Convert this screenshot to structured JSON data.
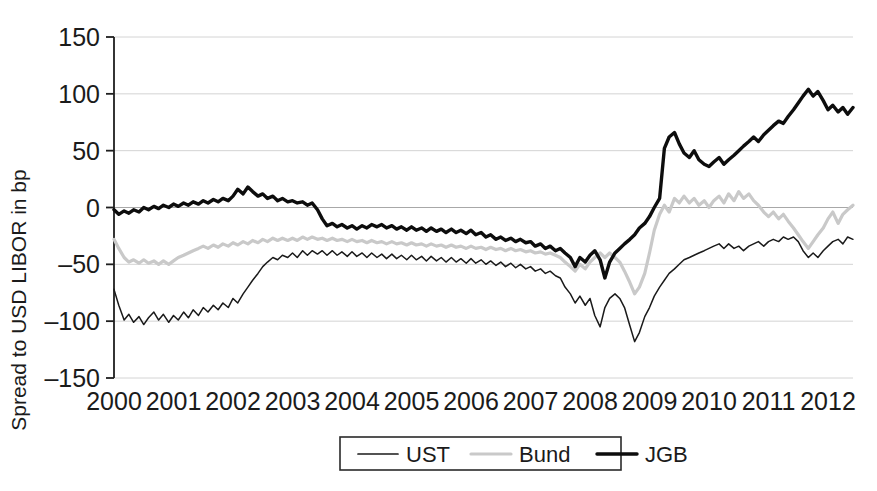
{
  "chart_data": {
    "type": "line",
    "title": "",
    "xlabel": "",
    "ylabel": "Spread to USD LIBOR in bp",
    "xlim": [
      2000.0,
      2012.42
    ],
    "ylim": [
      -150,
      150
    ],
    "ytick_labels": [
      "150",
      "100",
      "50",
      "0",
      "-50",
      "-100",
      "-150"
    ],
    "ytick_values": [
      150,
      100,
      50,
      0,
      -50,
      -100,
      -150
    ],
    "xtick_labels": [
      "2000",
      "2001",
      "2002",
      "2003",
      "2004",
      "2005",
      "2006",
      "2007",
      "2008",
      "2009",
      "2010",
      "2011",
      "2012"
    ],
    "xtick_values": [
      2000,
      2001,
      2002,
      2003,
      2004,
      2005,
      2006,
      2007,
      2008,
      2009,
      2010,
      2011,
      2012
    ],
    "grid": true,
    "legend_position": "bottom-center",
    "series": [
      {
        "name": "UST",
        "color": "#1a1a1a",
        "width": 1.5,
        "x": [
          2000.0,
          2000.08,
          2000.17,
          2000.25,
          2000.33,
          2000.42,
          2000.5,
          2000.58,
          2000.67,
          2000.75,
          2000.83,
          2000.92,
          2001.0,
          2001.08,
          2001.17,
          2001.25,
          2001.33,
          2001.42,
          2001.5,
          2001.58,
          2001.67,
          2001.75,
          2001.83,
          2001.92,
          2002.0,
          2002.08,
          2002.17,
          2002.25,
          2002.33,
          2002.42,
          2002.5,
          2002.58,
          2002.67,
          2002.75,
          2002.83,
          2002.92,
          2003.0,
          2003.08,
          2003.17,
          2003.25,
          2003.33,
          2003.42,
          2003.5,
          2003.58,
          2003.67,
          2003.75,
          2003.83,
          2003.92,
          2004.0,
          2004.08,
          2004.17,
          2004.25,
          2004.33,
          2004.42,
          2004.5,
          2004.58,
          2004.67,
          2004.75,
          2004.83,
          2004.92,
          2005.0,
          2005.08,
          2005.17,
          2005.25,
          2005.33,
          2005.42,
          2005.5,
          2005.58,
          2005.67,
          2005.75,
          2005.83,
          2005.92,
          2006.0,
          2006.08,
          2006.17,
          2006.25,
          2006.33,
          2006.42,
          2006.5,
          2006.58,
          2006.67,
          2006.75,
          2006.83,
          2006.92,
          2007.0,
          2007.08,
          2007.17,
          2007.25,
          2007.33,
          2007.42,
          2007.5,
          2007.58,
          2007.67,
          2007.75,
          2007.83,
          2007.92,
          2008.0,
          2008.08,
          2008.17,
          2008.25,
          2008.33,
          2008.42,
          2008.5,
          2008.58,
          2008.67,
          2008.75,
          2008.83,
          2008.92,
          2009.0,
          2009.08,
          2009.17,
          2009.25,
          2009.33,
          2009.42,
          2009.5,
          2009.58,
          2009.67,
          2009.75,
          2009.83,
          2009.92,
          2010.0,
          2010.08,
          2010.17,
          2010.25,
          2010.33,
          2010.42,
          2010.5,
          2010.58,
          2010.67,
          2010.75,
          2010.83,
          2010.92,
          2011.0,
          2011.08,
          2011.17,
          2011.25,
          2011.33,
          2011.42,
          2011.5,
          2011.58,
          2011.67,
          2011.75,
          2011.83,
          2011.92,
          2012.0,
          2012.08,
          2012.17,
          2012.25,
          2012.33,
          2012.42
        ],
        "y": [
          -72,
          -86,
          -99,
          -94,
          -101,
          -96,
          -103,
          -97,
          -92,
          -99,
          -94,
          -101,
          -95,
          -99,
          -92,
          -97,
          -90,
          -95,
          -88,
          -92,
          -86,
          -90,
          -84,
          -88,
          -80,
          -84,
          -76,
          -70,
          -64,
          -58,
          -52,
          -48,
          -44,
          -46,
          -42,
          -44,
          -40,
          -44,
          -38,
          -42,
          -38,
          -41,
          -38,
          -42,
          -38,
          -42,
          -39,
          -43,
          -39,
          -43,
          -40,
          -44,
          -40,
          -44,
          -41,
          -45,
          -41,
          -45,
          -42,
          -46,
          -42,
          -46,
          -43,
          -47,
          -43,
          -47,
          -44,
          -48,
          -44,
          -48,
          -45,
          -49,
          -45,
          -49,
          -46,
          -50,
          -47,
          -51,
          -48,
          -52,
          -49,
          -53,
          -50,
          -54,
          -52,
          -56,
          -54,
          -58,
          -56,
          -60,
          -62,
          -70,
          -76,
          -84,
          -78,
          -86,
          -80,
          -95,
          -105,
          -88,
          -80,
          -76,
          -80,
          -88,
          -104,
          -118,
          -110,
          -96,
          -88,
          -78,
          -70,
          -64,
          -58,
          -54,
          -50,
          -46,
          -44,
          -42,
          -40,
          -38,
          -36,
          -34,
          -32,
          -36,
          -32,
          -36,
          -34,
          -38,
          -34,
          -32,
          -30,
          -34,
          -30,
          -28,
          -30,
          -26,
          -28,
          -26,
          -30,
          -38,
          -44,
          -40,
          -44,
          -38,
          -34,
          -30,
          -28,
          -32,
          -26,
          -28
        ]
      },
      {
        "name": "Bund",
        "color": "#c9c9c9",
        "width": 3.2,
        "x": [
          2000.0,
          2000.08,
          2000.17,
          2000.25,
          2000.33,
          2000.42,
          2000.5,
          2000.58,
          2000.67,
          2000.75,
          2000.83,
          2000.92,
          2001.0,
          2001.08,
          2001.17,
          2001.25,
          2001.33,
          2001.42,
          2001.5,
          2001.58,
          2001.67,
          2001.75,
          2001.83,
          2001.92,
          2002.0,
          2002.08,
          2002.17,
          2002.25,
          2002.33,
          2002.42,
          2002.5,
          2002.58,
          2002.67,
          2002.75,
          2002.83,
          2002.92,
          2003.0,
          2003.08,
          2003.17,
          2003.25,
          2003.33,
          2003.42,
          2003.5,
          2003.58,
          2003.67,
          2003.75,
          2003.83,
          2003.92,
          2004.0,
          2004.08,
          2004.17,
          2004.25,
          2004.33,
          2004.42,
          2004.5,
          2004.58,
          2004.67,
          2004.75,
          2004.83,
          2004.92,
          2005.0,
          2005.08,
          2005.17,
          2005.25,
          2005.33,
          2005.42,
          2005.5,
          2005.58,
          2005.67,
          2005.75,
          2005.83,
          2005.92,
          2006.0,
          2006.08,
          2006.17,
          2006.25,
          2006.33,
          2006.42,
          2006.5,
          2006.58,
          2006.67,
          2006.75,
          2006.83,
          2006.92,
          2007.0,
          2007.08,
          2007.17,
          2007.25,
          2007.33,
          2007.42,
          2007.5,
          2007.58,
          2007.67,
          2007.75,
          2007.83,
          2007.92,
          2008.0,
          2008.08,
          2008.17,
          2008.25,
          2008.33,
          2008.42,
          2008.5,
          2008.58,
          2008.67,
          2008.75,
          2008.83,
          2008.92,
          2009.0,
          2009.08,
          2009.17,
          2009.25,
          2009.33,
          2009.42,
          2009.5,
          2009.58,
          2009.67,
          2009.75,
          2009.83,
          2009.92,
          2010.0,
          2010.08,
          2010.17,
          2010.25,
          2010.33,
          2010.42,
          2010.5,
          2010.58,
          2010.67,
          2010.75,
          2010.83,
          2010.92,
          2011.0,
          2011.08,
          2011.17,
          2011.25,
          2011.33,
          2011.42,
          2011.5,
          2011.58,
          2011.67,
          2011.75,
          2011.83,
          2011.92,
          2012.0,
          2012.08,
          2012.17,
          2012.25,
          2012.33,
          2012.42
        ],
        "y": [
          -28,
          -36,
          -44,
          -48,
          -46,
          -49,
          -46,
          -49,
          -47,
          -50,
          -47,
          -50,
          -47,
          -44,
          -42,
          -40,
          -38,
          -36,
          -34,
          -36,
          -33,
          -35,
          -32,
          -34,
          -31,
          -33,
          -30,
          -32,
          -29,
          -31,
          -28,
          -30,
          -27,
          -29,
          -27,
          -29,
          -27,
          -29,
          -26,
          -28,
          -26,
          -28,
          -27,
          -29,
          -27,
          -29,
          -28,
          -30,
          -28,
          -30,
          -29,
          -31,
          -29,
          -31,
          -30,
          -32,
          -30,
          -32,
          -31,
          -33,
          -31,
          -33,
          -32,
          -34,
          -32,
          -34,
          -33,
          -35,
          -33,
          -35,
          -34,
          -36,
          -34,
          -36,
          -35,
          -37,
          -35,
          -37,
          -36,
          -38,
          -36,
          -38,
          -37,
          -39,
          -38,
          -40,
          -39,
          -41,
          -40,
          -42,
          -44,
          -48,
          -52,
          -56,
          -50,
          -54,
          -48,
          -44,
          -40,
          -44,
          -40,
          -44,
          -48,
          -56,
          -66,
          -76,
          -70,
          -58,
          -40,
          -20,
          -6,
          2,
          -4,
          8,
          4,
          10,
          4,
          8,
          2,
          6,
          0,
          6,
          10,
          4,
          12,
          6,
          14,
          8,
          12,
          6,
          2,
          -4,
          -8,
          -4,
          -10,
          -6,
          -12,
          -18,
          -24,
          -30,
          -36,
          -30,
          -24,
          -18,
          -10,
          -4,
          -14,
          -6,
          -2,
          2
        ]
      },
      {
        "name": "JGB",
        "color": "#0d0d0d",
        "width": 3.4,
        "x": [
          2000.0,
          2000.08,
          2000.17,
          2000.25,
          2000.33,
          2000.42,
          2000.5,
          2000.58,
          2000.67,
          2000.75,
          2000.83,
          2000.92,
          2001.0,
          2001.08,
          2001.17,
          2001.25,
          2001.33,
          2001.42,
          2001.5,
          2001.58,
          2001.67,
          2001.75,
          2001.83,
          2001.92,
          2002.0,
          2002.08,
          2002.17,
          2002.25,
          2002.33,
          2002.42,
          2002.5,
          2002.58,
          2002.67,
          2002.75,
          2002.83,
          2002.92,
          2003.0,
          2003.08,
          2003.17,
          2003.25,
          2003.33,
          2003.42,
          2003.5,
          2003.58,
          2003.67,
          2003.75,
          2003.83,
          2003.92,
          2004.0,
          2004.08,
          2004.17,
          2004.25,
          2004.33,
          2004.42,
          2004.5,
          2004.58,
          2004.67,
          2004.75,
          2004.83,
          2004.92,
          2005.0,
          2005.08,
          2005.17,
          2005.25,
          2005.33,
          2005.42,
          2005.5,
          2005.58,
          2005.67,
          2005.75,
          2005.83,
          2005.92,
          2006.0,
          2006.08,
          2006.17,
          2006.25,
          2006.33,
          2006.42,
          2006.5,
          2006.58,
          2006.67,
          2006.75,
          2006.83,
          2006.92,
          2007.0,
          2007.08,
          2007.17,
          2007.25,
          2007.33,
          2007.42,
          2007.5,
          2007.58,
          2007.67,
          2007.75,
          2007.83,
          2007.92,
          2008.0,
          2008.08,
          2008.17,
          2008.25,
          2008.33,
          2008.42,
          2008.5,
          2008.58,
          2008.67,
          2008.75,
          2008.83,
          2008.92,
          2009.0,
          2009.08,
          2009.17,
          2009.25,
          2009.33,
          2009.42,
          2009.5,
          2009.58,
          2009.67,
          2009.75,
          2009.83,
          2009.92,
          2010.0,
          2010.08,
          2010.17,
          2010.25,
          2010.33,
          2010.42,
          2010.5,
          2010.58,
          2010.67,
          2010.75,
          2010.83,
          2010.92,
          2011.0,
          2011.08,
          2011.17,
          2011.25,
          2011.33,
          2011.42,
          2011.5,
          2011.58,
          2011.67,
          2011.75,
          2011.83,
          2011.92,
          2012.0,
          2012.08,
          2012.17,
          2012.25,
          2012.33,
          2012.42
        ],
        "y": [
          -2,
          -6,
          -3,
          -5,
          -2,
          -4,
          0,
          -2,
          1,
          -1,
          2,
          0,
          3,
          1,
          4,
          2,
          5,
          3,
          6,
          4,
          7,
          5,
          8,
          6,
          10,
          16,
          12,
          18,
          14,
          10,
          12,
          8,
          10,
          6,
          8,
          5,
          6,
          4,
          5,
          2,
          4,
          -2,
          -10,
          -16,
          -14,
          -17,
          -15,
          -18,
          -16,
          -19,
          -16,
          -18,
          -15,
          -17,
          -15,
          -18,
          -16,
          -19,
          -17,
          -20,
          -17,
          -20,
          -18,
          -21,
          -18,
          -21,
          -19,
          -22,
          -19,
          -22,
          -20,
          -23,
          -20,
          -24,
          -22,
          -26,
          -24,
          -28,
          -26,
          -29,
          -27,
          -30,
          -28,
          -31,
          -30,
          -34,
          -32,
          -36,
          -34,
          -38,
          -36,
          -40,
          -44,
          -52,
          -44,
          -48,
          -42,
          -38,
          -46,
          -62,
          -48,
          -40,
          -36,
          -32,
          -28,
          -24,
          -18,
          -14,
          -8,
          0,
          8,
          52,
          62,
          66,
          56,
          48,
          44,
          50,
          42,
          38,
          36,
          40,
          44,
          38,
          42,
          46,
          50,
          54,
          58,
          62,
          58,
          64,
          68,
          72,
          76,
          74,
          80,
          86,
          92,
          98,
          104,
          98,
          102,
          94,
          86,
          90,
          84,
          88,
          82,
          88
        ]
      }
    ]
  },
  "legend": {
    "items": [
      {
        "label": "UST",
        "color": "#1a1a1a"
      },
      {
        "label": "Bund",
        "color": "#c9c9c9"
      },
      {
        "label": "JGB",
        "color": "#0d0d0d"
      }
    ]
  }
}
